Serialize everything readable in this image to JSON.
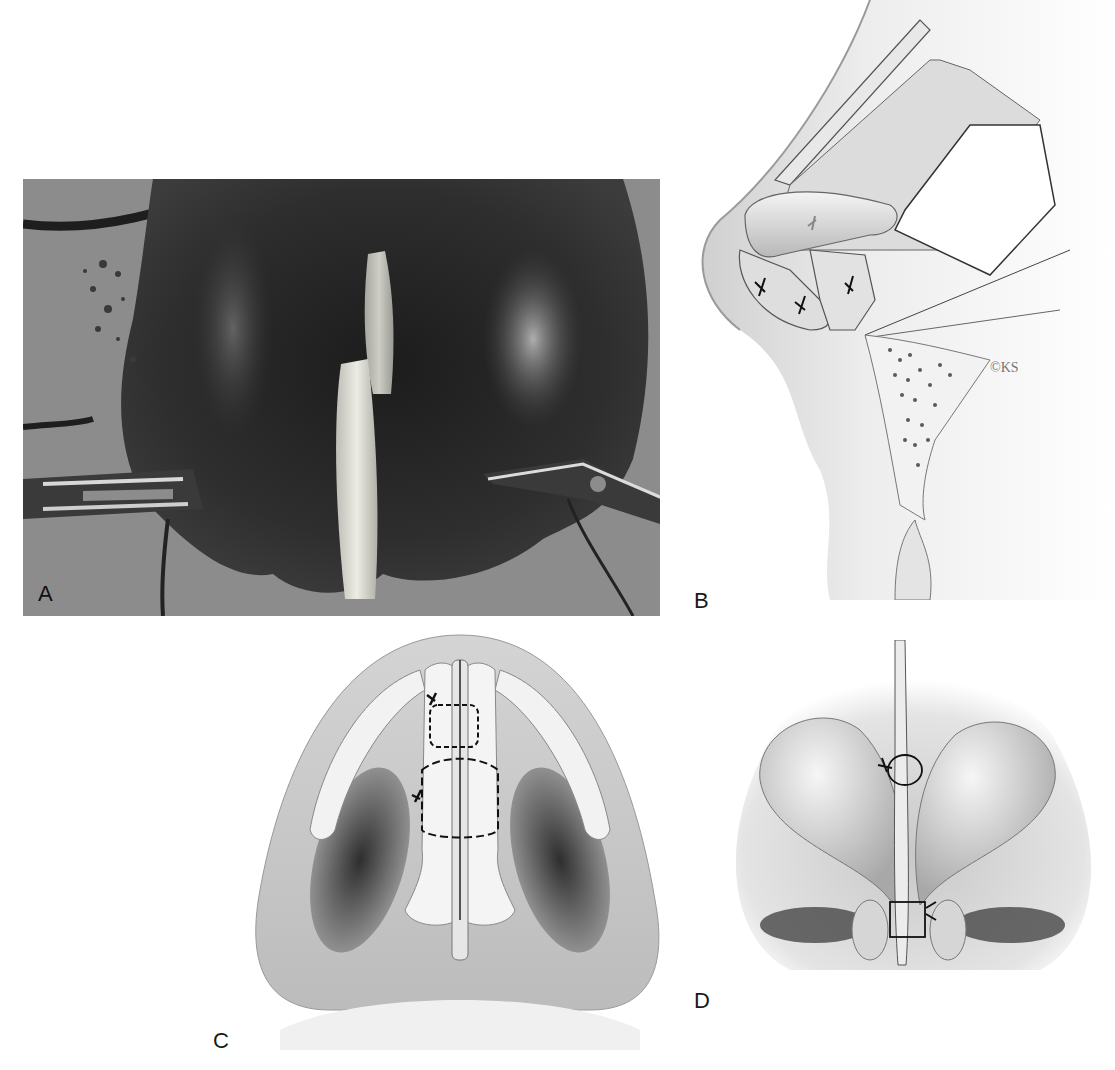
{
  "figure": {
    "panels": [
      {
        "id": "A",
        "label": "A",
        "type": "photograph",
        "description": "intraoperative photo of columellar strut graft between medial crura, held by retractors"
      },
      {
        "id": "B",
        "label": "B",
        "type": "illustration",
        "description": "lateral view of nasal tip with strut graft and suture fixation",
        "signature": "©KS"
      },
      {
        "id": "C",
        "label": "C",
        "type": "illustration",
        "description": "basal view showing strut graft sutured between medial crura (dashed suture loops)"
      },
      {
        "id": "D",
        "label": "D",
        "type": "illustration",
        "description": "frontal view of tip with strut graft and sutures"
      }
    ]
  },
  "colors": {
    "photo_background": "#8a8a8a",
    "tissue_dark": "#2a2a2a",
    "graft_light": "#d8d8d0",
    "illustration_fill": "#e6e6e6",
    "illustration_shadow": "#4a4a4a",
    "line": "#222222"
  }
}
